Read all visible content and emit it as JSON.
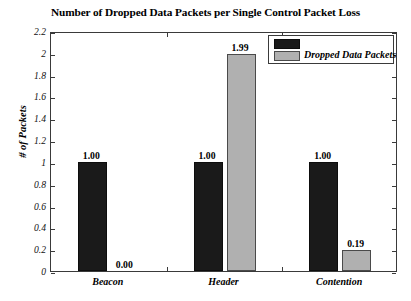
{
  "chart_data": {
    "type": "bar",
    "title": "Number of Dropped Data Packets per Single Control Packet Loss",
    "xlabel": "",
    "ylabel": "# of Packets",
    "categories": [
      "Beacon",
      "Header",
      "Contention"
    ],
    "series": [
      {
        "name": "Control Packet",
        "color": "#1a1a1a",
        "values": [
          1.0,
          1.0,
          1.0
        ],
        "labels": [
          "1.00",
          "1.00",
          "1.00"
        ]
      },
      {
        "name": "Dropped Data Packets",
        "color": "#b0b0b0",
        "values": [
          0.0,
          1.99,
          0.19
        ],
        "labels": [
          "0.00",
          "1.99",
          "0.19"
        ]
      }
    ],
    "ylim": [
      0,
      2.2
    ],
    "yticks": [
      0,
      0.2,
      0.4,
      0.6,
      0.8,
      1,
      1.2,
      1.4,
      1.6,
      1.8,
      2,
      2.2
    ],
    "ytick_labels": [
      "0",
      "0.2",
      "0.4",
      "0.6",
      "0.8",
      "1",
      "1.2",
      "1.4",
      "1.6",
      "1.8",
      "2",
      "2.2"
    ],
    "grid": false,
    "legend": {
      "position": "top-right",
      "label": "Dropped Data Packets",
      "swatches": [
        "#1a1a1a",
        "#b0b0b0"
      ]
    }
  }
}
